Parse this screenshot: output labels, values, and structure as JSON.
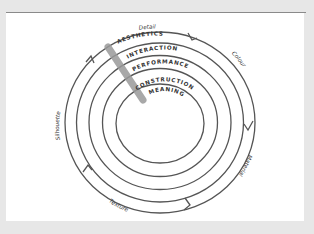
{
  "diagram": {
    "type": "concentric-rings",
    "center": {
      "x": 160,
      "y": 122.5
    },
    "rings": [
      {
        "label": "AESTHETICS",
        "rx": 83.5,
        "ry": 79.5
      },
      {
        "label": "INTERACTION",
        "rx": 71,
        "ry": 67
      },
      {
        "label": "PERFORMANCE",
        "rx": 57.5,
        "ry": 54
      },
      {
        "label": "CONSTRUCTION",
        "rx": 44,
        "ry": 40
      },
      {
        "label": "MEANING",
        "rx": 44,
        "ry": 39.5
      }
    ],
    "ring_labels": {
      "aesthetics": "AESTHETICS",
      "interaction": "INTERACTION",
      "performance": "PERFORMANCE",
      "construction": "CONSTRUCTION",
      "meaning": "MEANING"
    },
    "outer_labels": {
      "detail": "Detail",
      "colour": "Colour",
      "material": "Material",
      "texture": "Texture",
      "silhouette": "Silhouette"
    },
    "colors": {
      "background": "#e7e7e7",
      "panel": "#ffffff",
      "stroke": "#555555",
      "bar": "#9a9a9a"
    }
  }
}
